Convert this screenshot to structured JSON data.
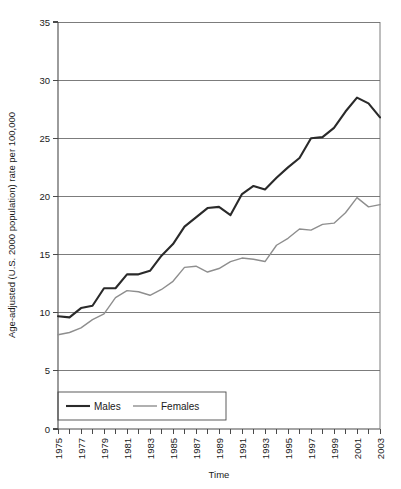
{
  "chart_data": {
    "type": "line",
    "title": "",
    "xlabel": "Time",
    "ylabel": "Age-adjusted (U.S. 2000 population) rate per 100,000",
    "xlim": [
      1975,
      2003
    ],
    "ylim": [
      0,
      35
    ],
    "yticks": [
      0,
      5,
      10,
      15,
      20,
      25,
      30,
      35
    ],
    "ytick_labels": [
      "0",
      "5",
      "10",
      "15",
      "20",
      "25",
      "30",
      "35"
    ],
    "xticks": [
      1975,
      1976,
      1977,
      1978,
      1979,
      1980,
      1981,
      1982,
      1983,
      1984,
      1985,
      1986,
      1987,
      1988,
      1989,
      1990,
      1991,
      1992,
      1993,
      1994,
      1995,
      1996,
      1997,
      1998,
      1999,
      2000,
      2001,
      2002,
      2003
    ],
    "xtick_labels": [
      "1975",
      "",
      "1977",
      "",
      "1979",
      "",
      "1981",
      "",
      "1983",
      "",
      "1985",
      "",
      "1987",
      "",
      "1989",
      "",
      "1991",
      "",
      "1993",
      "",
      "1995",
      "",
      "1997",
      "",
      "1999",
      "",
      "2001",
      "",
      "2003"
    ],
    "xtick_labels_shown": [
      "1975",
      "1977",
      "1979",
      "1981",
      "1983",
      "1985",
      "1987",
      "1989",
      "1991",
      "1993",
      "1995",
      "1997",
      "1999",
      "2001",
      "2003"
    ],
    "grid": "horizontal",
    "legend_position": "bottom-left",
    "x": [
      1975,
      1976,
      1977,
      1978,
      1979,
      1980,
      1981,
      1982,
      1983,
      1984,
      1985,
      1986,
      1987,
      1988,
      1989,
      1990,
      1991,
      1992,
      1993,
      1994,
      1995,
      1996,
      1997,
      1998,
      1999,
      2000,
      2001,
      2002,
      2003
    ],
    "series": [
      {
        "name": "Males",
        "color": "#2a2a2a",
        "width": 2.1,
        "values": [
          9.7,
          9.6,
          10.4,
          10.6,
          12.1,
          12.1,
          13.3,
          13.3,
          13.6,
          14.9,
          15.9,
          17.4,
          18.2,
          19.0,
          19.1,
          18.4,
          20.2,
          20.9,
          20.6,
          21.6,
          22.5,
          23.3,
          25.0,
          25.1,
          25.9,
          27.3,
          28.5,
          28.0,
          26.8
        ]
      },
      {
        "name": "Females",
        "color": "#8e8e8e",
        "width": 1.4,
        "values": [
          8.1,
          8.3,
          8.7,
          9.4,
          9.9,
          11.3,
          11.9,
          11.8,
          11.5,
          12.0,
          12.7,
          13.9,
          14.0,
          13.5,
          13.8,
          14.4,
          14.7,
          14.6,
          14.4,
          15.8,
          16.4,
          17.2,
          17.1,
          17.6,
          17.7,
          18.6,
          19.9,
          19.1,
          19.3
        ]
      }
    ]
  },
  "legend": {
    "items": [
      {
        "label": "Males"
      },
      {
        "label": "Females"
      }
    ]
  },
  "axes": {
    "y_title": "Age-adjusted (U.S. 2000 population) rate per 100,000",
    "x_title": "Time"
  }
}
